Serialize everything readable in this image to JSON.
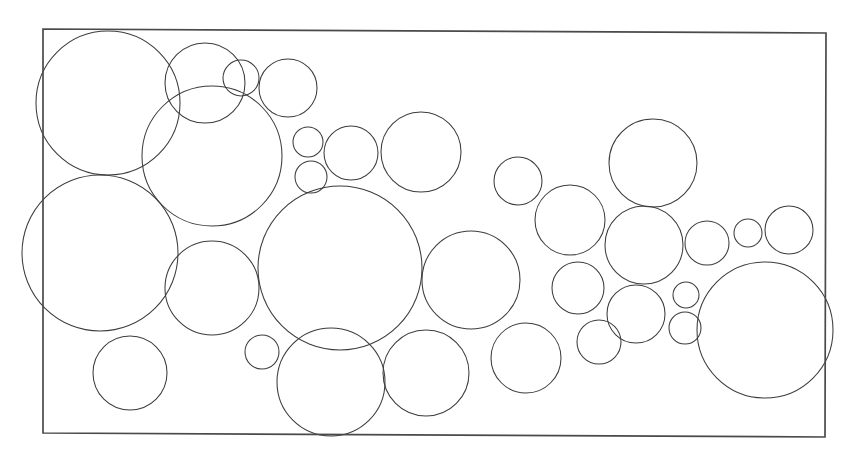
{
  "figure": {
    "caption": "",
    "background_color": "#ffffff",
    "stroke_color": "#3c3c3c",
    "frame_stroke_color": "#4a4a4a",
    "canvas": {
      "width": 864,
      "height": 459
    }
  },
  "chart_data": {
    "type": "scatter",
    "subtitle": "",
    "xlabel": "",
    "ylabel": "",
    "grid": false,
    "legend": null,
    "xlim": [
      43,
      826
    ],
    "ylim": [
      29,
      437
    ],
    "annotations": [],
    "frame": {
      "shape": "quadrilateral",
      "corners": [
        {
          "x": 43,
          "y": 29
        },
        {
          "x": 826,
          "y": 33
        },
        {
          "x": 825,
          "y": 437
        },
        {
          "x": 43,
          "y": 433
        }
      ],
      "stroke_width": 1.7
    },
    "circle_count": 41,
    "circles": [
      {
        "id": 1,
        "cx": 108,
        "cy": 103,
        "r": 72
      },
      {
        "id": 2,
        "cx": 100,
        "cy": 253,
        "r": 78
      },
      {
        "id": 3,
        "cx": 205,
        "cy": 83,
        "r": 40
      },
      {
        "id": 4,
        "cx": 241,
        "cy": 78,
        "r": 18
      },
      {
        "id": 5,
        "cx": 288,
        "cy": 88,
        "r": 29
      },
      {
        "id": 6,
        "cx": 212,
        "cy": 156,
        "r": 70
      },
      {
        "id": 7,
        "cx": 308,
        "cy": 142,
        "r": 15
      },
      {
        "id": 8,
        "cx": 311,
        "cy": 177,
        "r": 16
      },
      {
        "id": 9,
        "cx": 351,
        "cy": 153,
        "r": 27
      },
      {
        "id": 10,
        "cx": 421,
        "cy": 152,
        "r": 40
      },
      {
        "id": 11,
        "cx": 340,
        "cy": 268,
        "r": 82
      },
      {
        "id": 12,
        "cx": 212,
        "cy": 288,
        "r": 47
      },
      {
        "id": 13,
        "cx": 130,
        "cy": 373,
        "r": 37
      },
      {
        "id": 14,
        "cx": 262,
        "cy": 352,
        "r": 17
      },
      {
        "id": 15,
        "cx": 331,
        "cy": 382,
        "r": 54
      },
      {
        "id": 16,
        "cx": 426,
        "cy": 373,
        "r": 43
      },
      {
        "id": 17,
        "cx": 471,
        "cy": 280,
        "r": 49
      },
      {
        "id": 18,
        "cx": 518,
        "cy": 181,
        "r": 24
      },
      {
        "id": 19,
        "cx": 570,
        "cy": 220,
        "r": 35
      },
      {
        "id": 20,
        "cx": 578,
        "cy": 288,
        "r": 26
      },
      {
        "id": 21,
        "cx": 526,
        "cy": 358,
        "r": 35
      },
      {
        "id": 22,
        "cx": 599,
        "cy": 342,
        "r": 22
      },
      {
        "id": 23,
        "cx": 653,
        "cy": 163,
        "r": 44
      },
      {
        "id": 24,
        "cx": 644,
        "cy": 245,
        "r": 39
      },
      {
        "id": 25,
        "cx": 636,
        "cy": 314,
        "r": 29
      },
      {
        "id": 26,
        "cx": 707,
        "cy": 243,
        "r": 22
      },
      {
        "id": 27,
        "cx": 748,
        "cy": 233,
        "r": 14
      },
      {
        "id": 28,
        "cx": 789,
        "cy": 230,
        "r": 24
      },
      {
        "id": 29,
        "cx": 686,
        "cy": 295,
        "r": 13
      },
      {
        "id": 30,
        "cx": 685,
        "cy": 328,
        "r": 16
      },
      {
        "id": 31,
        "cx": 765,
        "cy": 330,
        "r": 68
      },
      {
        "id": 32,
        "cx": 463,
        "cy": 122,
        "r": 1
      },
      {
        "id": 33,
        "cx": 395,
        "cy": 213,
        "r": 1
      },
      {
        "id": 34,
        "cx": 271,
        "cy": 206,
        "r": 1
      },
      {
        "id": 35,
        "cx": 176,
        "cy": 214,
        "r": 1
      },
      {
        "id": 36,
        "cx": 162,
        "cy": 338,
        "r": 1
      },
      {
        "id": 37,
        "cx": 243,
        "cy": 330,
        "r": 1
      },
      {
        "id": 38,
        "cx": 487,
        "cy": 337,
        "r": 1
      },
      {
        "id": 39,
        "cx": 613,
        "cy": 205,
        "r": 1
      },
      {
        "id": 40,
        "cx": 676,
        "cy": 206,
        "r": 1
      },
      {
        "id": 41,
        "cx": 723,
        "cy": 279,
        "r": 1
      }
    ]
  }
}
